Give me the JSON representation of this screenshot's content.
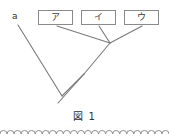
{
  "figure": {
    "caption": "図 1",
    "root_label": "a",
    "taxa": [
      {
        "id": "taxon-a",
        "label": "ア"
      },
      {
        "id": "taxon-i",
        "label": "イ"
      },
      {
        "id": "taxon-u",
        "label": "ウ"
      }
    ],
    "colors": {
      "line": "#7a7a7a",
      "box_border": "#8a8a8a",
      "text": "#2e2e2e",
      "background": "#ffffff",
      "ornament": "#8f8f8f"
    },
    "tree": {
      "type": "cladogram",
      "description": "Phylogenetic tree: a branches first from the root; ア branches next; イ and ウ are sister taxa.",
      "root_tip": {
        "x": 58,
        "y": 103
      },
      "nodes": [
        {
          "name": "node-root",
          "x": 62,
          "y": 96
        },
        {
          "name": "node-inner",
          "x": 84,
          "y": 74
        },
        {
          "name": "node-iu",
          "x": 110,
          "y": 43
        }
      ],
      "branches": [
        {
          "name": "branch-a",
          "from_x": 18,
          "from_y": 25,
          "to_x": 62,
          "to_y": 96
        },
        {
          "name": "branch-root-stem",
          "from_x": 62,
          "from_y": 96,
          "to_x": 84,
          "to_y": 74
        },
        {
          "name": "branch-stem-tip",
          "from_x": 84,
          "from_y": 74,
          "to_x": 58,
          "to_y": 103
        },
        {
          "name": "branch-ta",
          "from_x": 57,
          "from_y": 26,
          "to_x": 110,
          "to_y": 43
        },
        {
          "name": "branch-iu-stem",
          "from_x": 110,
          "from_y": 43,
          "to_x": 84,
          "to_y": 74
        },
        {
          "name": "branch-ti",
          "from_x": 99,
          "from_y": 26,
          "to_x": 110,
          "to_y": 43
        },
        {
          "name": "branch-tu",
          "from_x": 142,
          "from_y": 26,
          "to_x": 110,
          "to_y": 43
        }
      ]
    },
    "ornament": {
      "name": "scalloped-divider",
      "arc_count": 24
    }
  }
}
